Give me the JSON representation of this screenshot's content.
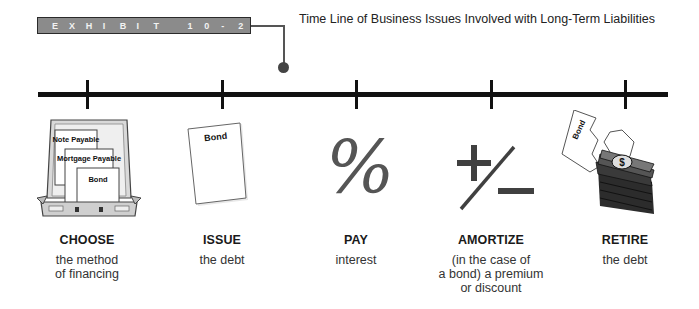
{
  "exhibit": {
    "label": "EXHIBIT 10-2",
    "letters": [
      "E",
      "X",
      "H",
      "I",
      "B",
      "I",
      "T",
      " ",
      "1",
      "0",
      "-",
      "2"
    ],
    "badge_color": "#8b8b8b",
    "border_color": "#2a2a2a"
  },
  "title": "Time Line of Business Issues Involved with Long-Term Liabilities",
  "timeline": {
    "color": "#111111",
    "steps": [
      {
        "title": "CHOOSE",
        "description": "the method\nof financing",
        "icon": "briefcase-icon",
        "icon_labels": [
          "Note Payable",
          "Mortgage Payable",
          "Bond"
        ]
      },
      {
        "title": "ISSUE",
        "description": "the debt",
        "icon": "bond-document-icon",
        "icon_labels": [
          "Bond"
        ]
      },
      {
        "title": "PAY",
        "description": "interest",
        "icon": "percent-icon",
        "icon_glyph": "%"
      },
      {
        "title": "AMORTIZE",
        "description": "(in the case of\na bond) a premium\nor discount",
        "icon": "plus-minus-icon"
      },
      {
        "title": "RETIRE",
        "description": "the debt",
        "icon": "torn-bond-money-icon",
        "icon_labels": [
          "Bond",
          "$"
        ]
      }
    ]
  }
}
